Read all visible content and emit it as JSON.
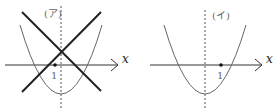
{
  "panels": [
    {
      "label": "(ア)",
      "axis_label": "x",
      "tick_label": "1"
    },
    {
      "label": "(イ)",
      "axis_label": "x",
      "tick_label": "1"
    }
  ]
}
